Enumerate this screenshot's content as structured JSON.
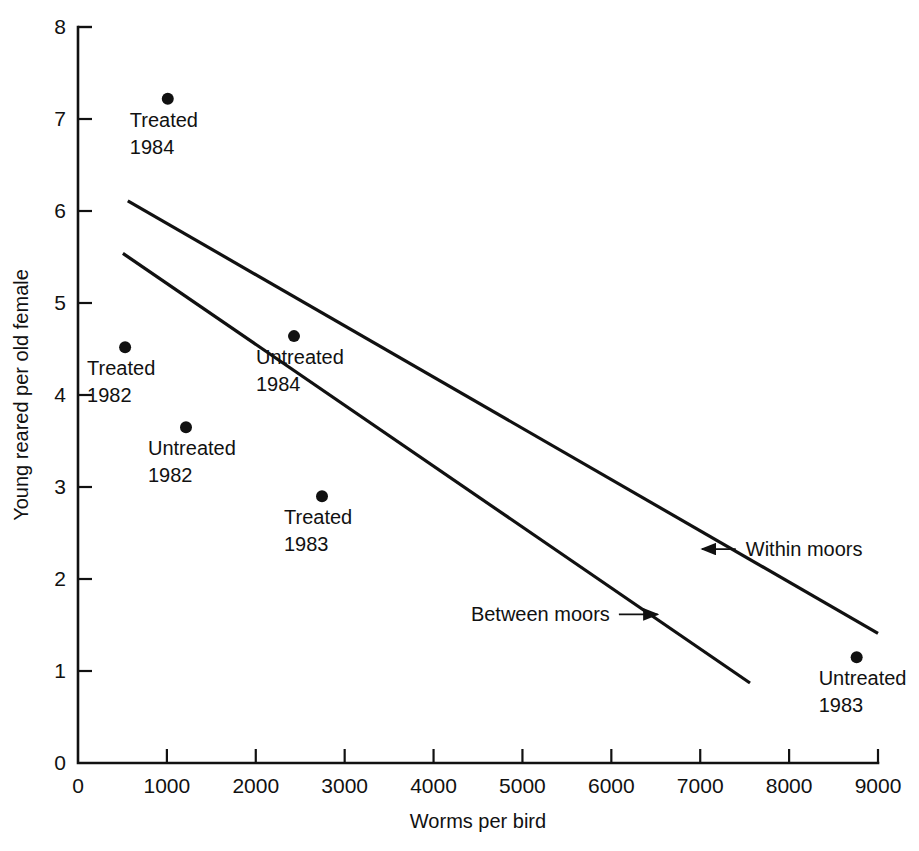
{
  "chart_data": {
    "type": "scatter",
    "title": "",
    "xlabel": "Worms per bird",
    "ylabel": "Young reared per old female",
    "xlim": [
      0,
      9000
    ],
    "ylim": [
      0,
      8
    ],
    "xticks": [
      0,
      1000,
      2000,
      3000,
      4000,
      5000,
      6000,
      7000,
      8000,
      9000
    ],
    "xtick_labels": [
      "0",
      "1000",
      "2000",
      "3000",
      "4000",
      "5000",
      "6000",
      "7000",
      "8000",
      "9000"
    ],
    "yticks": [
      0,
      1,
      2,
      3,
      4,
      5,
      6,
      7,
      8
    ],
    "ytick_labels": [
      "0",
      "1",
      "2",
      "3",
      "4",
      "5",
      "6",
      "7",
      "8"
    ],
    "grid": false,
    "legend": "none",
    "points": [
      {
        "label_line1": "Treated",
        "label_line2": "1984",
        "x": 1010,
        "y": 7.22,
        "label_pos": "below"
      },
      {
        "label_line1": "Treated",
        "label_line2": "1982",
        "x": 530,
        "y": 4.52,
        "label_pos": "below"
      },
      {
        "label_line1": "Untreated",
        "label_line2": "1982",
        "x": 1215,
        "y": 3.65,
        "label_pos": "below"
      },
      {
        "label_line1": "Untreated",
        "label_line2": "1984",
        "x": 2430,
        "y": 4.64,
        "label_pos": "below"
      },
      {
        "label_line1": "Treated",
        "label_line2": "1983",
        "x": 2745,
        "y": 2.9,
        "label_pos": "below"
      },
      {
        "label_line1": "Untreated",
        "label_line2": "1983",
        "x": 8760,
        "y": 1.15,
        "label_pos": "below"
      }
    ],
    "lines": [
      {
        "name": "Within moors",
        "x0": 560,
        "y0": 6.11,
        "x1": 9000,
        "y1": 1.41
      },
      {
        "name": "Between moors",
        "x0": 505,
        "y0": 5.54,
        "x1": 7560,
        "y1": 0.87
      }
    ],
    "annotations": [
      {
        "text": "Within moors",
        "text_x": 7490,
        "text_y": 2.26,
        "arrow_to_x": 7470,
        "arrow_to_y": 2.26
      },
      {
        "text": "Between moors",
        "text_x": 4420,
        "text_y": 1.55,
        "arrow_to_x": 6520,
        "arrow_to_y": 1.55
      }
    ],
    "marker_color": "#111111",
    "line_color": "#111111"
  },
  "page": {
    "number": ""
  }
}
